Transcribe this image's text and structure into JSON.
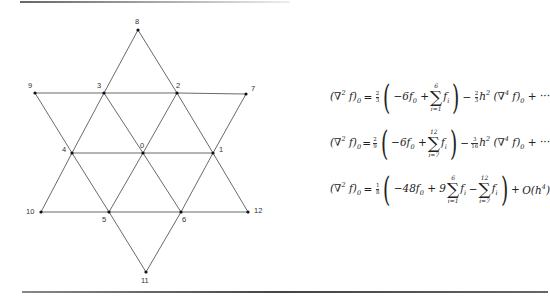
{
  "figure": {
    "type": "finite-difference-stencil",
    "nodes": [
      {
        "id": "0",
        "x": 143,
        "y": 153,
        "lx": 140,
        "ly": 148
      },
      {
        "id": "1",
        "x": 213,
        "y": 153,
        "lx": 219,
        "ly": 152
      },
      {
        "id": "2",
        "x": 177,
        "y": 93,
        "lx": 176,
        "ly": 88
      },
      {
        "id": "3",
        "x": 104,
        "y": 93,
        "lx": 97,
        "ly": 88
      },
      {
        "id": "4",
        "x": 72,
        "y": 153,
        "lx": 62,
        "ly": 152
      },
      {
        "id": "5",
        "x": 109,
        "y": 212,
        "lx": 102,
        "ly": 222
      },
      {
        "id": "6",
        "x": 181,
        "y": 212,
        "lx": 182,
        "ly": 222
      },
      {
        "id": "7",
        "x": 246,
        "y": 94,
        "lx": 251,
        "ly": 91
      },
      {
        "id": "8",
        "x": 138,
        "y": 30,
        "lx": 135,
        "ly": 24
      },
      {
        "id": "9",
        "x": 35,
        "y": 93,
        "lx": 28,
        "ly": 88
      },
      {
        "id": "10",
        "x": 41,
        "y": 212,
        "lx": 26,
        "ly": 214
      },
      {
        "id": "11",
        "x": 146,
        "y": 272,
        "lx": 141,
        "ly": 283
      },
      {
        "id": "12",
        "x": 248,
        "y": 212,
        "lx": 254,
        "ly": 213
      }
    ],
    "edges": [
      [
        "8",
        "3"
      ],
      [
        "3",
        "4"
      ],
      [
        "4",
        "10"
      ],
      [
        "10",
        "5"
      ],
      [
        "5",
        "11"
      ],
      [
        "11",
        "6"
      ],
      [
        "6",
        "12"
      ],
      [
        "12",
        "1"
      ],
      [
        "1",
        "7"
      ],
      [
        "7",
        "2"
      ],
      [
        "2",
        "8"
      ],
      [
        "9",
        "3"
      ],
      [
        "3",
        "2"
      ],
      [
        "2",
        "7"
      ],
      [
        "9",
        "4"
      ],
      [
        "4",
        "5"
      ],
      [
        "5",
        "6"
      ],
      [
        "6",
        "1"
      ],
      [
        "4",
        "0"
      ],
      [
        "0",
        "1"
      ],
      [
        "10",
        "5"
      ],
      [
        "6",
        "12"
      ],
      [
        "3",
        "0"
      ],
      [
        "0",
        "6"
      ],
      [
        "2",
        "0"
      ],
      [
        "0",
        "5"
      ],
      [
        "4",
        "3"
      ],
      [
        "2",
        "1"
      ],
      [
        "5",
        "4"
      ],
      [
        "1",
        "6"
      ],
      [
        "3",
        "9"
      ]
    ],
    "line_color": "#444444",
    "node_color": "#111111"
  },
  "equations": [
    {
      "lhs": "(∇² f)₀",
      "coef": {
        "num": "2",
        "den": "3"
      },
      "inner_lead": "−6f₀ +",
      "sum": {
        "upper": "6",
        "lower": "i=1",
        "term": "fᵢ"
      },
      "tail_coef": {
        "num": "2",
        "den": "3"
      },
      "tail": "h² (∇⁴ f)₀ + ···"
    },
    {
      "lhs": "(∇² f)₀",
      "coef": {
        "num": "2",
        "den": "9"
      },
      "inner_lead": "−6f₀ +",
      "sum": {
        "upper": "12",
        "lower": "i=7",
        "term": "fᵢ"
      },
      "tail_coef": {
        "num": "3",
        "den": "16"
      },
      "tail": "h² (∇⁴ f)₀ + ···"
    },
    {
      "lhs": "(∇² f)₀",
      "coef": {
        "num": "1",
        "den": "8"
      },
      "inner_lead": "−48f₀ + 9",
      "sum": {
        "upper": "6",
        "lower": "i=1",
        "term": "fᵢ"
      },
      "sum2": {
        "upper": "12",
        "lower": "i=7",
        "term": "fᵢ"
      },
      "tail": "O(h⁴)"
    }
  ]
}
